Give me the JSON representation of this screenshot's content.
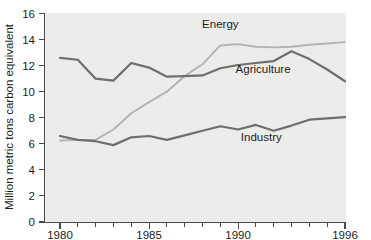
{
  "chart_data": {
    "type": "line",
    "title": "",
    "xlabel": "",
    "ylabel": "Million metric tons carbon equivalent",
    "xlim": [
      1980,
      1996
    ],
    "ylim": [
      0,
      16
    ],
    "ytick_step": 2,
    "grid": false,
    "legend_position": "inline-labels",
    "x": [
      1980,
      1981,
      1982,
      1983,
      1984,
      1985,
      1986,
      1987,
      1988,
      1989,
      1990,
      1991,
      1992,
      1993,
      1994,
      1995,
      1996
    ],
    "xticks_major": [
      "1980",
      "1985",
      "1990",
      "1996"
    ],
    "xticks_major_values": [
      1980,
      1985,
      1990,
      1996
    ],
    "xticks_all": [
      1980,
      1981,
      1982,
      1983,
      1984,
      1985,
      1986,
      1987,
      1988,
      1989,
      1990,
      1991,
      1992,
      1993,
      1994,
      1995,
      1996
    ],
    "yticks": [
      0,
      2,
      4,
      6,
      8,
      10,
      12,
      14,
      16
    ],
    "ytick_labels": [
      "0",
      "2",
      "4",
      "6",
      "8",
      "10",
      "12",
      "14",
      "16"
    ],
    "series": [
      {
        "name": "Energy",
        "color": "#b3b3b3",
        "label_x": 1989.0,
        "label_y": 14.85,
        "values": [
          6.25,
          6.3,
          6.3,
          7.1,
          8.35,
          9.2,
          10.0,
          11.2,
          12.1,
          13.55,
          13.65,
          13.45,
          13.4,
          13.45,
          13.6,
          13.7,
          13.8
        ]
      },
      {
        "name": "Agriculture",
        "color": "#6e6e6e",
        "label_x": 1991.4,
        "label_y": 11.45,
        "values": [
          12.6,
          12.45,
          11.0,
          10.85,
          12.2,
          11.85,
          11.15,
          11.2,
          11.25,
          11.8,
          12.05,
          12.2,
          12.35,
          13.1,
          12.5,
          11.7,
          10.8
        ]
      },
      {
        "name": "Industry",
        "color": "#6e6e6e",
        "label_x": 1991.3,
        "label_y": 6.25,
        "values": [
          6.6,
          6.3,
          6.2,
          5.9,
          6.5,
          6.6,
          6.3,
          6.65,
          7.0,
          7.35,
          7.1,
          7.45,
          7.0,
          7.4,
          7.85,
          7.95,
          8.05
        ]
      }
    ]
  },
  "axes": {
    "y_axis_title": "Million metric tons carbon equivalent"
  },
  "colors": {
    "plot_background": "#ececeb",
    "page_background": "#ffffff",
    "axis": "#4a4a4a",
    "text": "#1d1d1d",
    "energy_line": "#b3b3b3",
    "agriculture_line": "#6e6e6e",
    "industry_line": "#6e6e6e"
  }
}
